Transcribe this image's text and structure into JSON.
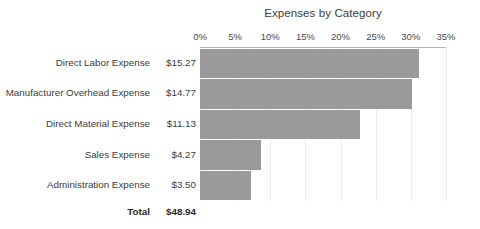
{
  "chart_data": {
    "type": "bar",
    "orientation": "horizontal",
    "title": "Expenses by Category",
    "xlabel": "",
    "ylabel": "",
    "categories": [
      "Direct Labor Expense",
      "Manufacturer Overhead Expense",
      "Direct Material Expense",
      "Sales Expense",
      "Administration Expense"
    ],
    "amount_labels": [
      "$15.27",
      "$14.77",
      "$11.13",
      "$4.27",
      "$3.50"
    ],
    "amounts": [
      15.27,
      14.77,
      11.13,
      4.27,
      3.5
    ],
    "values": [
      31.2,
      30.2,
      22.7,
      8.7,
      7.2
    ],
    "value_unit": "percent",
    "xlim": [
      0,
      35
    ],
    "tick_labels": [
      "0%",
      "5%",
      "10%",
      "15%",
      "20%",
      "25%",
      "30%",
      "35%"
    ],
    "tick_values": [
      0,
      5,
      10,
      15,
      20,
      25,
      30,
      35
    ],
    "grid": true,
    "legend": false,
    "bar_color": "#9a9a9a",
    "gridline_color": "#ededed",
    "axis_color": "#b4b4b4",
    "total_label": "Total",
    "total_value": "$48.94"
  }
}
